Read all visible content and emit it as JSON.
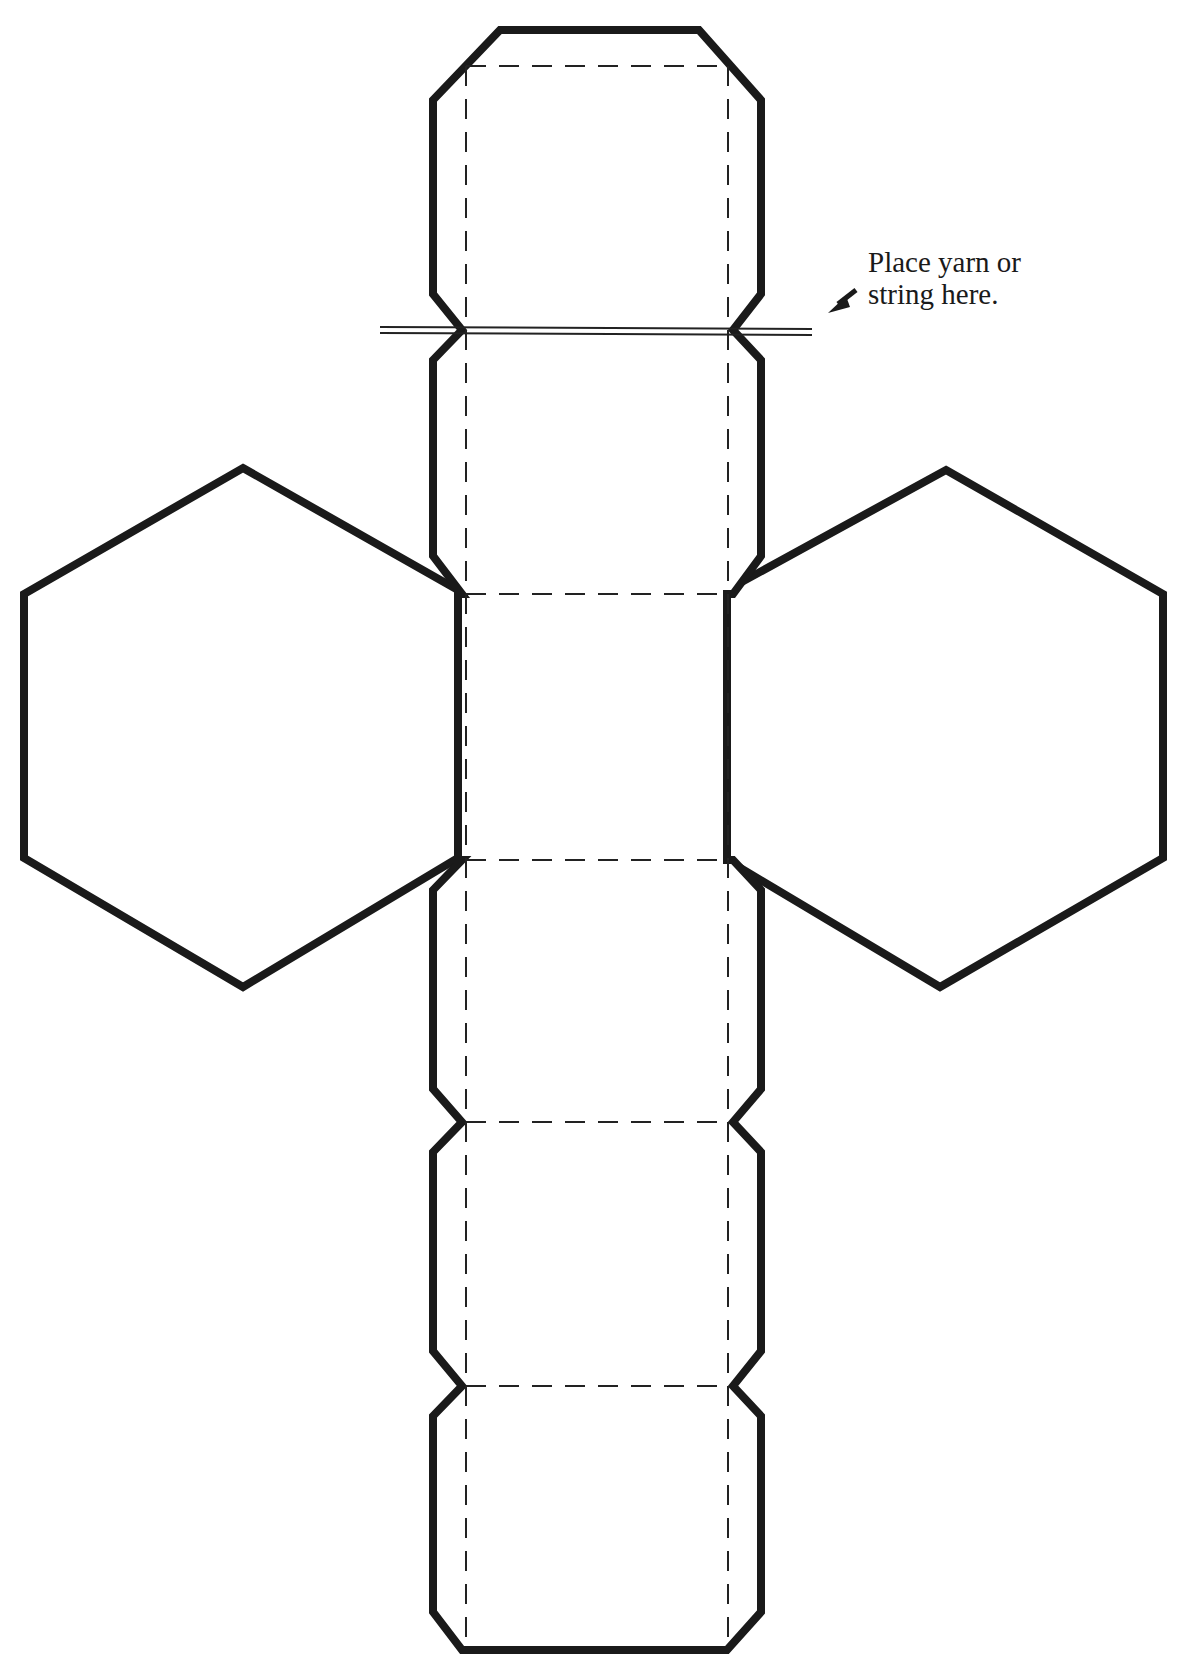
{
  "diagram": {
    "type": "paper-craft-template",
    "colors": {
      "outline": "#1a1a1a",
      "fold_line": "#222222",
      "background": "#ffffff"
    },
    "annotation": {
      "line1": "Place yarn or",
      "line2": "string here.",
      "arrow": "arrow-pointing-down-left"
    },
    "legend": {
      "solid_line": "cut line",
      "dashed_line": "fold line",
      "double_line": "yarn / string placement"
    },
    "faces": {
      "strip_faces": 6,
      "hexagon_caps": 2
    }
  }
}
